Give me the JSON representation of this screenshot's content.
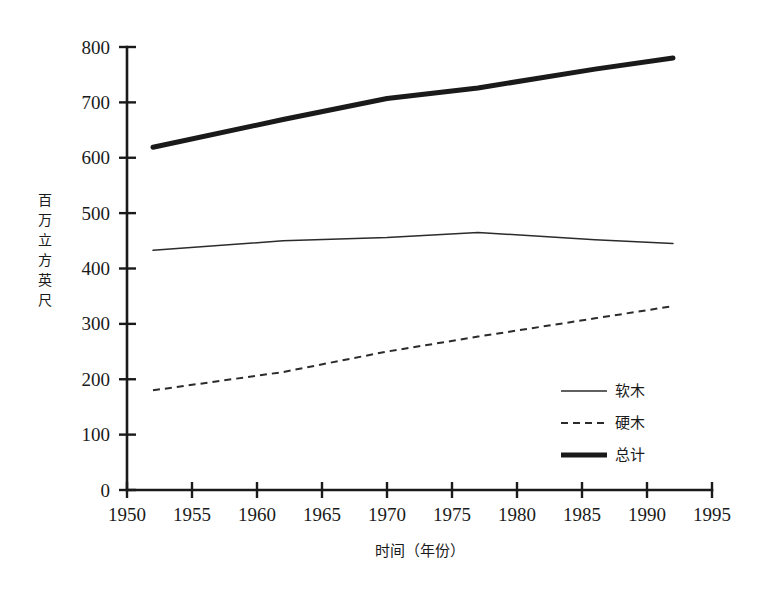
{
  "chart_data": {
    "type": "line",
    "title": "",
    "xlabel": "时间（年份）",
    "ylabel": "百万立方英尺",
    "xlim": [
      1950,
      1995
    ],
    "ylim": [
      0,
      800
    ],
    "grid": false,
    "legend_position": "inside-bottom-right",
    "x_ticks": [
      "1950",
      "1955",
      "1960",
      "1965",
      "1970",
      "1975",
      "1980",
      "1985",
      "1990",
      "1995"
    ],
    "x_tick_values": [
      1950,
      1955,
      1960,
      1965,
      1970,
      1975,
      1980,
      1985,
      1990,
      1995
    ],
    "y_ticks": [
      "0",
      "100",
      "200",
      "300",
      "400",
      "500",
      "600",
      "700",
      "800"
    ],
    "y_tick_values": [
      0,
      100,
      200,
      300,
      400,
      500,
      600,
      700,
      800
    ],
    "x": [
      1952,
      1962,
      1970,
      1977,
      1986,
      1992
    ],
    "series": [
      {
        "name": "软木",
        "style": "solid-thin",
        "values": [
          433,
          450,
          456,
          465,
          452,
          445
        ]
      },
      {
        "name": "硬木",
        "style": "dashed",
        "values": [
          180,
          213,
          250,
          277,
          310,
          332
        ]
      },
      {
        "name": "总计",
        "style": "solid-thick",
        "values": [
          619,
          669,
          707,
          726,
          760,
          780
        ]
      }
    ]
  },
  "legend": {
    "items": [
      {
        "label": "软木"
      },
      {
        "label": "硬木"
      },
      {
        "label": "总计"
      }
    ]
  },
  "axes": {
    "y_title_chars": [
      "百",
      "万",
      "立",
      "方",
      "英",
      "尺"
    ],
    "x_title": "时间（年份）"
  },
  "colors": {
    "ink": "#1a1a1a",
    "line": "#2b2b2b",
    "background": "#ffffff"
  }
}
